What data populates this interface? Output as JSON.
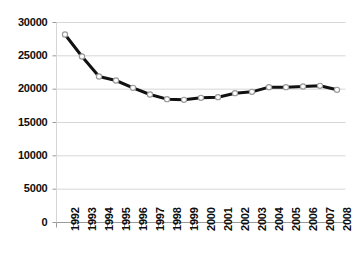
{
  "chart_data": {
    "type": "line",
    "title": "",
    "xlabel": "",
    "ylabel": "",
    "categories": [
      "1992",
      "1993",
      "1994",
      "1995",
      "1996",
      "1997",
      "1998",
      "1999",
      "2000",
      "2001",
      "2002",
      "2003",
      "2004",
      "2005",
      "2006",
      "2007",
      "2008"
    ],
    "values": [
      28200,
      24900,
      21900,
      21300,
      20200,
      19200,
      18500,
      18400,
      18700,
      18800,
      19400,
      19600,
      20300,
      20300,
      20400,
      20500,
      19900
    ],
    "series": [
      {
        "name": "series-1",
        "values": [
          28200,
          24900,
          21900,
          21300,
          20200,
          19200,
          18500,
          18400,
          18700,
          18800,
          19400,
          19600,
          20300,
          20300,
          20400,
          20500,
          19900
        ]
      }
    ],
    "y_ticks": [
      0,
      5000,
      10000,
      15000,
      20000,
      25000,
      30000
    ],
    "y_tick_labels": [
      "0",
      "5000",
      "10000",
      "15000",
      "20000",
      "25000",
      "30000"
    ],
    "ylim": [
      0,
      30000
    ],
    "grid": "horizontal",
    "legend": "none",
    "line_color": "#111111",
    "marker_fill": "#ffffff",
    "marker_edge": "#9a9a9a",
    "gridline_color": "#d6d6d6",
    "axis_color": "#9a9a9a",
    "text_color": "#0d0d0d"
  }
}
